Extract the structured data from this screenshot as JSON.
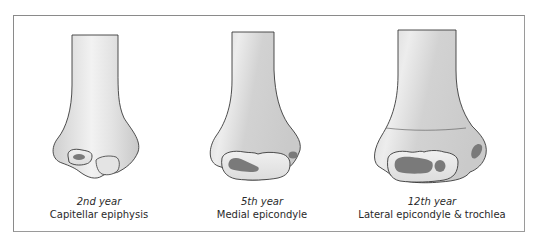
{
  "figure": {
    "panels": [
      {
        "id": "panel-2nd-year",
        "year_label": "2nd year",
        "center_label": "Capitellar epiphysis",
        "center_x": 99
      },
      {
        "id": "panel-5th-year",
        "year_label": "5th year",
        "center_label": "Medial epicondyle",
        "center_x": 262
      },
      {
        "id": "panel-12th-year",
        "year_label": "12th year",
        "center_label": "Lateral epicondyle & trochlea",
        "center_x": 432
      }
    ],
    "colors": {
      "frame_border": "#8a8a8a",
      "bone_fill_light": "#ececec",
      "bone_fill_mid": "#d6d6d6",
      "bone_outline": "#3a3a3a",
      "ossification_center": "#7a7a7a",
      "caption_text": "#2a2a2a"
    }
  }
}
